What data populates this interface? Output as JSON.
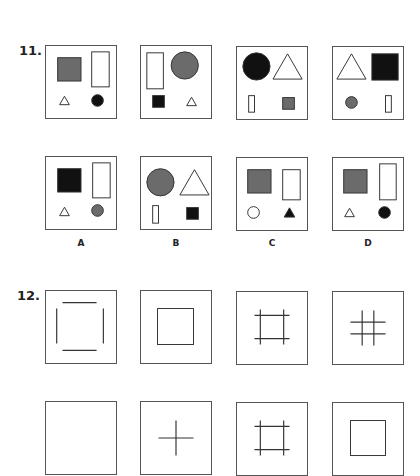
{
  "colors": {
    "gray": "#6b6b6b",
    "black": "#111111",
    "line": "#333333",
    "white": "#ffffff"
  },
  "questions": [
    {
      "number": "11.",
      "stem": [
        {
          "shapes": [
            {
              "t": "rect",
              "x": 12,
              "y": 12,
              "w": 24,
              "h": 24,
              "fill": "gray"
            },
            {
              "t": "rect",
              "x": 47,
              "y": 6,
              "w": 18,
              "h": 36,
              "fill": "white"
            },
            {
              "t": "tri",
              "cx": 19,
              "cy": 56,
              "s": 10,
              "fill": "white"
            },
            {
              "t": "circle",
              "cx": 53,
              "cy": 56,
              "r": 6,
              "fill": "black"
            }
          ]
        },
        {
          "shapes": [
            {
              "t": "rect",
              "x": 6,
              "y": 7,
              "w": 17,
              "h": 37,
              "fill": "white"
            },
            {
              "t": "circle",
              "cx": 45,
              "cy": 20,
              "r": 14,
              "fill": "gray"
            },
            {
              "t": "rect",
              "x": 12,
              "y": 51,
              "w": 12,
              "h": 12,
              "fill": "black"
            },
            {
              "t": "tri",
              "cx": 52,
              "cy": 57,
              "s": 10,
              "fill": "white"
            }
          ]
        },
        {
          "shapes": [
            {
              "t": "circle",
              "cx": 20,
              "cy": 20,
              "r": 14,
              "fill": "black"
            },
            {
              "t": "tri",
              "cx": 52,
              "cy": 20,
              "s": 30,
              "fill": "white"
            },
            {
              "t": "rect",
              "x": 12,
              "y": 50,
              "w": 6,
              "h": 17,
              "fill": "white"
            },
            {
              "t": "rect",
              "x": 47,
              "y": 52,
              "w": 12,
              "h": 12,
              "fill": "gray"
            }
          ]
        },
        {
          "shapes": [
            {
              "t": "tri",
              "cx": 19,
              "cy": 20,
              "s": 30,
              "fill": "white"
            },
            {
              "t": "rect",
              "x": 40,
              "y": 7,
              "w": 27,
              "h": 27,
              "fill": "black"
            },
            {
              "t": "circle",
              "cx": 19,
              "cy": 57,
              "r": 6,
              "fill": "gray"
            },
            {
              "t": "rect",
              "x": 54,
              "y": 50,
              "w": 6,
              "h": 17,
              "fill": "white"
            }
          ]
        }
      ],
      "options": [
        {
          "label": "A",
          "shapes": [
            {
              "t": "rect",
              "x": 12,
              "y": 12,
              "w": 24,
              "h": 24,
              "fill": "black"
            },
            {
              "t": "rect",
              "x": 48,
              "y": 6,
              "w": 18,
              "h": 36,
              "fill": "white"
            },
            {
              "t": "tri",
              "cx": 19,
              "cy": 56,
              "s": 10,
              "fill": "white"
            },
            {
              "t": "circle",
              "cx": 53,
              "cy": 55,
              "r": 6,
              "fill": "gray"
            }
          ]
        },
        {
          "label": "B",
          "shapes": [
            {
              "t": "circle",
              "cx": 20,
              "cy": 26,
              "r": 14,
              "fill": "gray"
            },
            {
              "t": "tri",
              "cx": 55,
              "cy": 26,
              "s": 30,
              "fill": "white"
            },
            {
              "t": "rect",
              "x": 12,
              "y": 50,
              "w": 6,
              "h": 18,
              "fill": "white"
            },
            {
              "t": "rect",
              "x": 47,
              "y": 52,
              "w": 12,
              "h": 12,
              "fill": "black"
            }
          ]
        },
        {
          "label": "C",
          "shapes": [
            {
              "t": "rect",
              "x": 11,
              "y": 12,
              "w": 24,
              "h": 24,
              "fill": "gray"
            },
            {
              "t": "rect",
              "x": 47,
              "y": 12,
              "w": 18,
              "h": 31,
              "fill": "white"
            },
            {
              "t": "circle",
              "cx": 17,
              "cy": 56,
              "r": 6,
              "fill": "white"
            },
            {
              "t": "tri",
              "cx": 54,
              "cy": 56,
              "s": 11,
              "fill": "black"
            }
          ]
        },
        {
          "label": "D",
          "shapes": [
            {
              "t": "rect",
              "x": 11,
              "y": 12,
              "w": 24,
              "h": 24,
              "fill": "gray"
            },
            {
              "t": "rect",
              "x": 48,
              "y": 6,
              "w": 17,
              "h": 37,
              "fill": "white"
            },
            {
              "t": "tri",
              "cx": 17,
              "cy": 56,
              "s": 10,
              "fill": "white"
            },
            {
              "t": "circle",
              "cx": 53,
              "cy": 56,
              "r": 6,
              "fill": "black"
            }
          ]
        }
      ]
    },
    {
      "number": "12.",
      "stem": [
        {
          "shapes": [
            {
              "t": "line",
              "x1": 17,
              "y1": 12,
              "x2": 52,
              "y2": 12
            },
            {
              "t": "line",
              "x1": 11,
              "y1": 18,
              "x2": 11,
              "y2": 54
            },
            {
              "t": "line",
              "x1": 59,
              "y1": 18,
              "x2": 59,
              "y2": 54
            },
            {
              "t": "line",
              "x1": 17,
              "y1": 61,
              "x2": 52,
              "y2": 61
            }
          ]
        },
        {
          "shapes": [
            {
              "t": "rect",
              "x": 17,
              "y": 18,
              "w": 37,
              "h": 37,
              "fill": "none"
            }
          ]
        },
        {
          "shapes": [
            {
              "t": "line",
              "x1": 18,
              "y1": 24,
              "x2": 54,
              "y2": 24
            },
            {
              "t": "line",
              "x1": 18,
              "y1": 48,
              "x2": 54,
              "y2": 48
            },
            {
              "t": "line",
              "x1": 24,
              "y1": 18,
              "x2": 24,
              "y2": 54
            },
            {
              "t": "line",
              "x1": 48,
              "y1": 18,
              "x2": 48,
              "y2": 54
            }
          ]
        },
        {
          "shapes": [
            {
              "t": "line",
              "x1": 18,
              "y1": 31,
              "x2": 54,
              "y2": 31
            },
            {
              "t": "line",
              "x1": 18,
              "y1": 43,
              "x2": 54,
              "y2": 43
            },
            {
              "t": "line",
              "x1": 30,
              "y1": 19,
              "x2": 30,
              "y2": 55
            },
            {
              "t": "line",
              "x1": 42,
              "y1": 19,
              "x2": 42,
              "y2": 55
            }
          ]
        }
      ],
      "options": [
        {
          "label": "",
          "shapes": []
        },
        {
          "label": "",
          "shapes": [
            {
              "t": "line",
              "x1": 18,
              "y1": 37,
              "x2": 54,
              "y2": 37
            },
            {
              "t": "line",
              "x1": 36,
              "y1": 19,
              "x2": 36,
              "y2": 55
            }
          ]
        },
        {
          "label": "",
          "shapes": [
            {
              "t": "line",
              "x1": 18,
              "y1": 24,
              "x2": 54,
              "y2": 24
            },
            {
              "t": "line",
              "x1": 18,
              "y1": 48,
              "x2": 54,
              "y2": 48
            },
            {
              "t": "line",
              "x1": 24,
              "y1": 18,
              "x2": 24,
              "y2": 54
            },
            {
              "t": "line",
              "x1": 48,
              "y1": 18,
              "x2": 48,
              "y2": 54
            }
          ]
        },
        {
          "label": "",
          "shapes": [
            {
              "t": "rect",
              "x": 18,
              "y": 18,
              "w": 36,
              "h": 36,
              "fill": "none"
            }
          ]
        }
      ]
    }
  ]
}
